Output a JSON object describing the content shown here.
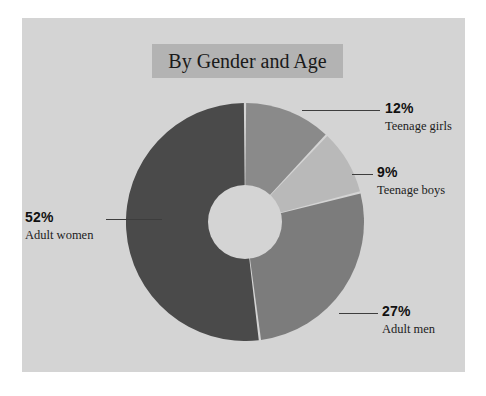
{
  "figure": {
    "background_color": "#ffffff",
    "panel_color": "#d4d4d4",
    "title_band_color": "#b3b3b3"
  },
  "title": "By Gender and Age",
  "chart_data": {
    "type": "pie",
    "variant": "donut",
    "title": "By Gender and Age",
    "subtitle": "",
    "xlabel": "",
    "ylabel": "",
    "units": "percent",
    "total": 100,
    "start_angle_deg": 0,
    "direction": "clockwise",
    "inner_radius_ratio": 0.31,
    "legend": "none",
    "grid": false,
    "labels_inline": false,
    "categories": [
      "Teenage girls",
      "Teenage boys",
      "Adult men",
      "Adult women"
    ],
    "values": [
      12,
      9,
      27,
      52
    ],
    "colors": [
      "#8a8a8a",
      "#b9b9b9",
      "#7c7c7c",
      "#4a4a4a"
    ],
    "slice_gap_color": "#d4d4d4",
    "slices": [
      {
        "label": "Teenage girls",
        "value": 12,
        "value_text": "12%",
        "color": "#8a8a8a",
        "callout_side": "right"
      },
      {
        "label": "Teenage boys",
        "value": 9,
        "value_text": "9%",
        "color": "#b9b9b9",
        "callout_side": "right"
      },
      {
        "label": "Adult men",
        "value": 27,
        "value_text": "27%",
        "color": "#7c7c7c",
        "callout_side": "right"
      },
      {
        "label": "Adult women",
        "value": 52,
        "value_text": "52%",
        "color": "#4a4a4a",
        "callout_side": "left"
      }
    ]
  },
  "callouts": {
    "teenage_girls": {
      "pct": "12%",
      "name": "Teenage girls"
    },
    "teenage_boys": {
      "pct": "9%",
      "name": "Teenage boys"
    },
    "adult_men": {
      "pct": "27%",
      "name": "Adult men"
    },
    "adult_women": {
      "pct": "52%",
      "name": "Adult women"
    }
  }
}
